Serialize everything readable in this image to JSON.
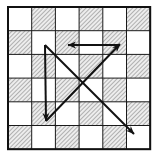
{
  "figure": {
    "canvas": {
      "width": 158,
      "height": 158,
      "background": "#ffffff"
    }
  },
  "chart_data": {
    "type": "scatter",
    "subtitle": "",
    "xlabel": "",
    "ylabel": "",
    "xlim": [
      0,
      6
    ],
    "ylim": [
      0,
      6
    ],
    "grid": true,
    "legend_position": "none",
    "tick_labels_x": [],
    "tick_labels_y": [],
    "annotations": []
  },
  "grid": {
    "name": "checkerboard",
    "rows": 6,
    "cols": 6,
    "origin_x": 8,
    "origin_y": 7,
    "cell_width": 23.7,
    "cell_height": 23.7,
    "line_color": "#1a1a1a",
    "line_width": 1,
    "border_color": "#111111",
    "border_width": 2,
    "fill_white": "#ffffff",
    "fill_hatch_base": "#e8e8e8",
    "hatch_color": "#8a8a8a",
    "hatch_angle_deg": 45,
    "hatch_spacing": 2,
    "first_cell_filled": false,
    "pattern_description": "alternating: row0 starts white, hatched squares on (row+col) odd",
    "cells": [
      [
        "white",
        "hatch",
        "white",
        "hatch",
        "white",
        "hatch"
      ],
      [
        "hatch",
        "white",
        "hatch",
        "white",
        "hatch",
        "white"
      ],
      [
        "white",
        "hatch",
        "white",
        "hatch",
        "white",
        "hatch"
      ],
      [
        "hatch",
        "white",
        "hatch",
        "white",
        "hatch",
        "white"
      ],
      [
        "white",
        "hatch",
        "white",
        "hatch",
        "white",
        "hatch"
      ],
      [
        "hatch",
        "white",
        "hatch",
        "white",
        "hatch",
        "white"
      ]
    ]
  },
  "vectors": {
    "stroke_color": "#111111",
    "stroke_width": 2,
    "arrow_head_length": 9,
    "arrow_head_width": 6,
    "items": [
      {
        "id": "vector-vertical-down",
        "label": "vertical down arrow",
        "x1": 45,
        "y1": 45,
        "x2": 46,
        "y2": 121,
        "arrow_at": "end",
        "direction": "down"
      },
      {
        "id": "vector-main-diagonal",
        "label": "main diagonal down-right arrow",
        "x1": 45,
        "y1": 45,
        "x2": 134,
        "y2": 134,
        "arrow_at": "end",
        "direction": "down-right"
      },
      {
        "id": "vector-rising-diagonal",
        "label": "rising diagonal up-right arrow",
        "x1": 46,
        "y1": 121,
        "x2": 120,
        "y2": 44,
        "arrow_at": "end",
        "direction": "up-right"
      },
      {
        "id": "vector-horizontal-left",
        "label": "horizontal left arrow",
        "x1": 120,
        "y1": 45,
        "x2": 68,
        "y2": 45,
        "arrow_at": "end",
        "direction": "left"
      }
    ]
  },
  "colors": {
    "ink": "#111111",
    "paper": "#ffffff",
    "hatch": "#8a8a8a",
    "hatch_fill": "#e8e8e8"
  }
}
